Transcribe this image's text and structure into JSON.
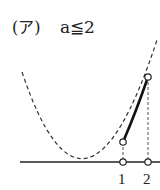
{
  "label": {
    "case": "(ア)",
    "condition": "a≦2"
  },
  "graph": {
    "x_ticks": [
      {
        "label": "1",
        "value": 1
      },
      {
        "label": "2",
        "value": 2
      }
    ],
    "curve": "parabola (dashed), solid segment between x=1 and x=2",
    "open_points": [
      "(1, f(1))",
      "(2, f(2))",
      "(1, 0)",
      "(2, 0)"
    ]
  }
}
